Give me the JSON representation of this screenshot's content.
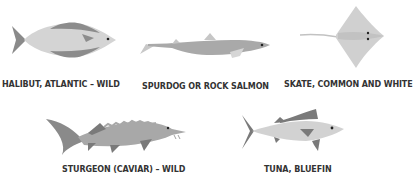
{
  "fish": [
    {
      "name": "HALIBUT, ATLANTIC – WILD",
      "icon": "halibut-icon"
    },
    {
      "name": "SPURDOG OR ROCK SALMON",
      "icon": "spurdog-icon"
    },
    {
      "name": "SKATE, COMMON AND WHITE",
      "icon": "skate-icon"
    },
    {
      "name": "STURGEON (CAVIAR) – WILD",
      "icon": "sturgeon-icon"
    },
    {
      "name": "TUNA, BLUEFIN",
      "icon": "tuna-icon"
    }
  ],
  "colors": {
    "light": "#d2d2d2",
    "mid": "#a8a8a8",
    "dark": "#7a7a7a",
    "text": "#333333"
  }
}
